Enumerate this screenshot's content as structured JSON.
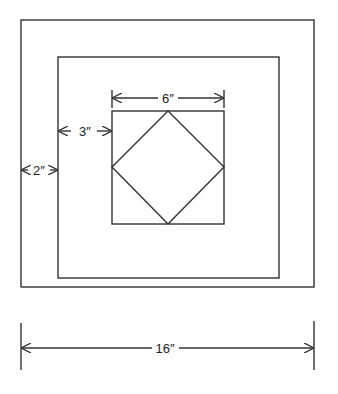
{
  "diagram": {
    "type": "quilt-block-dimensions",
    "shapes": {
      "outer_square": {
        "x": 21,
        "y": 20,
        "w": 293,
        "h": 267
      },
      "middle_square": {
        "x": 58,
        "y": 57,
        "w": 221,
        "h": 221
      },
      "inner_square": {
        "x": 112,
        "y": 111,
        "w": 112,
        "h": 113
      },
      "inner_diamond": {
        "points": "168,111 224,167 168,224 112,167"
      }
    },
    "dimensions": [
      {
        "id": "inner",
        "label": "6″",
        "from": 112,
        "to": 224,
        "y": 98
      },
      {
        "id": "middle-border",
        "label": "3″",
        "from": 58,
        "to": 112,
        "y": 131
      },
      {
        "id": "outer-border",
        "label": "2″",
        "from": 21,
        "to": 58,
        "y": 170
      },
      {
        "id": "overall",
        "label": "16″",
        "from": 21,
        "to": 314,
        "y": 348
      }
    ]
  },
  "labels": {
    "dim_6": "6″",
    "dim_3": "3″",
    "dim_2": "2″",
    "dim_16": "16″"
  }
}
